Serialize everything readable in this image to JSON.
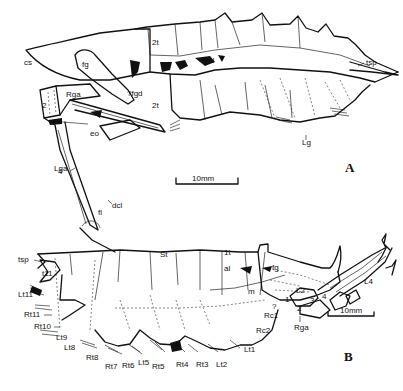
{
  "figure": {
    "panels": [
      {
        "id": "A",
        "label": "A",
        "scale_bar": "10mm",
        "annotations": {
          "cs": "cs",
          "fg": "fg",
          "tf_top": "2t",
          "tf_bottom": "2t",
          "fgd": "?fgd",
          "al": "al",
          "tsp": "tsp",
          "rga": "Rga",
          "seg2": "2",
          "seg4": "4",
          "eo": "eo",
          "lga": "Lga",
          "dcl": "dcl",
          "fl": "fl",
          "lg": "Lg"
        }
      },
      {
        "id": "B",
        "label": "B",
        "scale_bar": "10mm",
        "annotations": {
          "tsp": "tsp",
          "t11": "t11",
          "lt11": "Lt11",
          "rt11": "Rt11",
          "rt10": "Rt10",
          "lt9": "Lt9",
          "lt8": "Lt8",
          "rt8": "Rt8",
          "rt7": "Rt7",
          "rt6": "Rt6",
          "lt5": "Lt5",
          "rt5": "Rt5",
          "rt4": "Rt4",
          "rt3": "Rt3",
          "lt2": "Lt2",
          "lt1": "Lt1",
          "rc2": "Rc2",
          "rc1": "Rc1",
          "q": "?",
          "st": "St",
          "t1": "1t",
          "al": "al",
          "fg": "fg",
          "m": "m",
          "seg1": "1",
          "l2": "L2",
          "seg2": "2",
          "seg3": "3",
          "seg4": "4",
          "l4": "L4",
          "rga": "Rga"
        }
      }
    ]
  }
}
